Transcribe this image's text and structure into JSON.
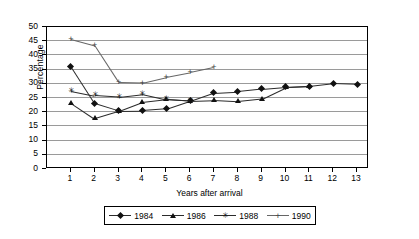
{
  "chart_data": {
    "type": "line",
    "title": "",
    "xlabel": "Years after arrival",
    "ylabel": "Percentage",
    "x": [
      1,
      2,
      3,
      4,
      5,
      6,
      7,
      8,
      9,
      10,
      11,
      12,
      13
    ],
    "xlim": [
      0,
      13.5
    ],
    "ylim": [
      0,
      50
    ],
    "yticks": [
      0,
      5,
      10,
      15,
      20,
      25,
      30,
      35,
      40,
      45,
      50
    ],
    "xticks": [
      1,
      2,
      3,
      4,
      5,
      6,
      7,
      8,
      9,
      10,
      11,
      12,
      13
    ],
    "grid": "horizontal",
    "legend_position": "bottom",
    "series": [
      {
        "name": "1984",
        "marker": "diamond",
        "x": [
          1,
          2,
          3,
          4,
          5,
          6,
          7,
          8,
          9,
          10,
          11,
          12,
          13
        ],
        "values": [
          36.2,
          23.1,
          20.5,
          20.6,
          21.2,
          24.0,
          26.9,
          27.3,
          28.2,
          28.9,
          29.2,
          30.2,
          29.9
        ]
      },
      {
        "name": "1986",
        "marker": "triangle",
        "x": [
          1,
          2,
          3,
          4,
          5,
          6,
          7,
          8,
          9,
          10,
          11
        ],
        "values": [
          23.4,
          17.8,
          20.3,
          23.5,
          24.5,
          24.0,
          24.3,
          23.9,
          24.8,
          28.8,
          29.2
        ]
      },
      {
        "name": "1988",
        "marker": "star",
        "x": [
          1,
          2,
          3,
          4,
          5,
          6
        ],
        "values": [
          27.6,
          25.9,
          25.4,
          26.4,
          24.5,
          24.0
        ]
      },
      {
        "name": "1990",
        "marker": "plus",
        "x": [
          1,
          2,
          3,
          4,
          5,
          6,
          7
        ],
        "values": [
          45.8,
          43.5,
          30.6,
          30.4,
          32.4,
          34.0,
          35.8
        ]
      }
    ]
  },
  "legend": {
    "items": [
      {
        "label": "1984",
        "marker": "diamond"
      },
      {
        "label": "1986",
        "marker": "triangle"
      },
      {
        "label": "1988",
        "marker": "star"
      },
      {
        "label": "1990",
        "marker": "plus"
      }
    ]
  },
  "colors": {
    "line": "#2b2b2b",
    "marker": "#111111",
    "grid": "#9a9a9a",
    "axis": "#000000",
    "background": "#ffffff"
  }
}
